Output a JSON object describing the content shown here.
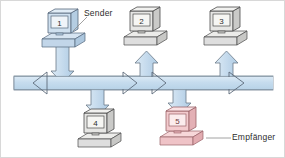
{
  "diagram": {
    "type": "network-bus-topology",
    "labels": {
      "sender": "Sender",
      "receiver": "Empfänger"
    },
    "colors": {
      "bus_fill": "#c9dced",
      "bus_stroke": "#6e7c8a",
      "arrow_fill": "#c2d8ea",
      "arrow_stroke": "#5d6b7a",
      "sender_fill": "#bfd4e8",
      "sender_stroke": "#55677c",
      "receiver_fill": "#f0c3c6",
      "receiver_stroke": "#9a6268",
      "neutral_fill": "#e3e3e0",
      "neutral_stroke": "#4a4a4a",
      "screen_fill": "#f2f2ee",
      "label_text": "#2d2d2d",
      "leader_line": "#8a8a8a",
      "page_border": "#d8d8d8"
    },
    "nodes": [
      {
        "id": "pc1",
        "number": "1",
        "role": "sender",
        "position": "top-left",
        "color": "blue",
        "flow": "down",
        "x": 42,
        "y": 12
      },
      {
        "id": "pc2",
        "number": "2",
        "role": "station",
        "position": "top-center",
        "color": "neutral",
        "flow": "up",
        "x": 124,
        "y": 10
      },
      {
        "id": "pc3",
        "number": "3",
        "role": "station",
        "position": "top-right",
        "color": "neutral",
        "flow": "up",
        "x": 204,
        "y": 10
      },
      {
        "id": "pc4",
        "number": "4",
        "role": "station",
        "position": "bottom-left",
        "color": "neutral",
        "flow": "down",
        "x": 78,
        "y": 112
      },
      {
        "id": "pc5",
        "number": "5",
        "role": "receiver",
        "position": "bottom-right",
        "color": "red",
        "flow": "down",
        "x": 160,
        "y": 110
      }
    ],
    "bus": {
      "orientation": "horizontal",
      "left_arrow": "west",
      "right_arrow": "east",
      "inline_arrows": [
        "east",
        "east",
        "east"
      ]
    }
  }
}
